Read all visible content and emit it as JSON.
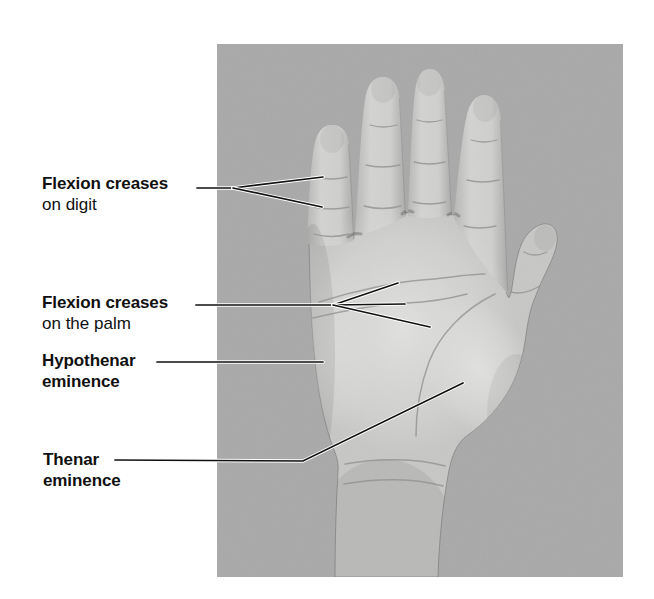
{
  "figure": {
    "type": "labeled-anatomical-photo",
    "background_color": "#ffffff",
    "photo": {
      "background_color": "#a9a9a9",
      "x": 217,
      "y": 44,
      "width": 406,
      "height": 533,
      "description": "Photograph of a hand, palm facing viewer, fingers extended upward, thumb on the right"
    },
    "labels": [
      {
        "name": "flexion-creases-digit",
        "x": 42,
        "y": 173,
        "lines": [
          {
            "text": "Flexion creases",
            "bold": true
          },
          {
            "text": "on digit",
            "bold": false
          }
        ]
      },
      {
        "name": "flexion-creases-palm",
        "x": 42,
        "y": 292,
        "lines": [
          {
            "text": "Flexion creases",
            "bold": true
          },
          {
            "text": "on the palm",
            "bold": false
          }
        ]
      },
      {
        "name": "hypothenar-eminence",
        "x": 42,
        "y": 350,
        "lines": [
          {
            "text": "Hypothenar",
            "bold": true
          },
          {
            "text": "eminence",
            "bold": true
          }
        ]
      },
      {
        "name": "thenar-eminence",
        "x": 43,
        "y": 449,
        "lines": [
          {
            "text": "Thenar",
            "bold": true
          },
          {
            "text": "eminence",
            "bold": true
          }
        ]
      }
    ],
    "leaders": [
      {
        "name": "leader-flexion-creases-digit",
        "color": "#111111",
        "segments": [
          [
            [
              197,
              188
            ],
            [
              233,
              188
            ]
          ],
          [
            [
              233,
              188
            ],
            [
              323,
              177
            ]
          ],
          [
            [
              233,
              188
            ],
            [
              322,
              207
            ]
          ]
        ]
      },
      {
        "name": "leader-flexion-creases-palm",
        "color": "#111111",
        "segments": [
          [
            [
              196,
              305
            ],
            [
              333,
              305
            ]
          ],
          [
            [
              333,
              305
            ],
            [
              398,
              283
            ]
          ],
          [
            [
              333,
              305
            ],
            [
              405,
              304
            ]
          ],
          [
            [
              333,
              305
            ],
            [
              430,
              327
            ]
          ]
        ]
      },
      {
        "name": "leader-hypothenar-eminence",
        "color": "#111111",
        "segments": [
          [
            [
              157,
              362
            ],
            [
              323,
              362
            ]
          ]
        ]
      },
      {
        "name": "leader-thenar-eminence",
        "color": "#111111",
        "segments": [
          [
            [
              115,
              460
            ],
            [
              303,
              461
            ],
            [
              463,
              383
            ]
          ]
        ]
      }
    ]
  }
}
